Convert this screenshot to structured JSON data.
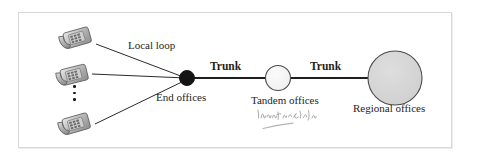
{
  "figure": {
    "background_color": "#ffffff",
    "frame_color": "#d8d8d8"
  },
  "labels": {
    "local_loop": "Local loop",
    "end_offices": "End offices",
    "trunk_1": "Trunk",
    "trunk_2": "Trunk",
    "tandem_offices": "Tandem offices",
    "regional_offices": "Regional offices"
  },
  "annotation": {
    "type": "handwritten-scribble",
    "legible": false,
    "text": "",
    "color": "#9a9a9a",
    "has_underline": true
  },
  "nodes": [
    {
      "name": "end-offices-node",
      "shape": "circle",
      "fill": "#1a1a1a",
      "stroke": "#1a1a1a",
      "cx": 187,
      "cy": 78,
      "r": 7.5,
      "label": "End offices"
    },
    {
      "name": "tandem-offices-node",
      "shape": "circle",
      "fill": "#f2f2f2",
      "stroke": "#4a4a4a",
      "cx": 278,
      "cy": 78,
      "r": 12.5,
      "label": "Tandem offices"
    },
    {
      "name": "regional-offices-node",
      "shape": "circle",
      "fill": "#d4d4d4",
      "stroke": "#4a4a4a",
      "cx": 395,
      "cy": 78,
      "r": 27,
      "label": "Regional offices"
    }
  ],
  "endpoints": [
    {
      "name": "telephone-1",
      "icon": "telephone-icon",
      "x": 58,
      "y": 22
    },
    {
      "name": "telephone-2",
      "icon": "telephone-icon",
      "x": 55,
      "y": 59
    },
    {
      "name": "telephone-3",
      "icon": "telephone-icon",
      "x": 57,
      "y": 108
    }
  ],
  "ellipsis": {
    "name": "vertical-ellipsis",
    "dot_count": 3,
    "meaning": "more telephones"
  },
  "links": [
    {
      "name": "local-loop-link-1",
      "from": "telephone-1",
      "to": "end-offices-node",
      "label": "Local loop",
      "style": "thin"
    },
    {
      "name": "local-loop-link-2",
      "from": "telephone-2",
      "to": "end-offices-node",
      "label": "",
      "style": "thin"
    },
    {
      "name": "local-loop-link-3",
      "from": "telephone-3",
      "to": "end-offices-node",
      "label": "",
      "style": "thin"
    },
    {
      "name": "trunk-link-1",
      "from": "end-offices-node",
      "to": "tandem-offices-node",
      "label": "Trunk",
      "style": "thick"
    },
    {
      "name": "trunk-link-2",
      "from": "tandem-offices-node",
      "to": "regional-offices-node",
      "label": "Trunk",
      "style": "thick"
    }
  ]
}
